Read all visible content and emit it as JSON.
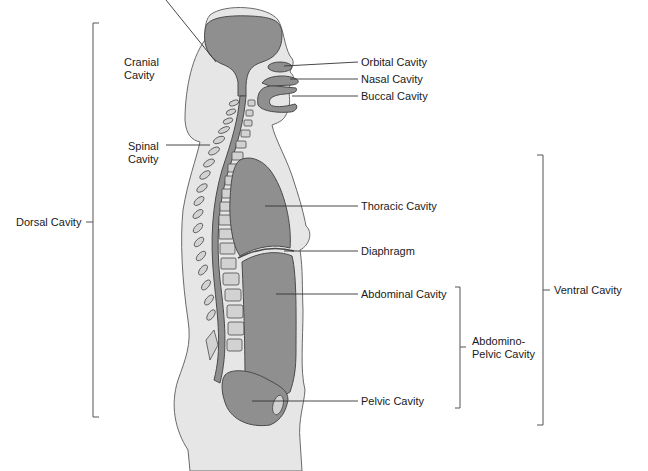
{
  "colors": {
    "body_fill": "#e6e6e6",
    "body_outline": "#6a6a6a",
    "cavity_fill": "#8f8f8f",
    "cavity_outline": "#4a4a4a",
    "vertebra_fill": "#d2d2d2",
    "line": "#333333"
  },
  "labels": {
    "cranial": [
      "Cranial",
      "Cavity"
    ],
    "orbital": "Orbital Cavity",
    "nasal": "Nasal Cavity",
    "buccal": "Buccal Cavity",
    "spinal": [
      "Spinal",
      "Cavity"
    ],
    "dorsal": "Dorsal Cavity",
    "thoracic": "Thoracic Cavity",
    "diaphragm": "Diaphragm",
    "abdominal": "Abdominal Cavity",
    "abdomino_pelvic": [
      "Abdomino-",
      "Pelvic Cavity"
    ],
    "pelvic": "Pelvic Cavity",
    "ventral": "Ventral Cavity"
  },
  "brackets": {
    "dorsal": {
      "x": 93,
      "y1": 23,
      "y2": 417
    },
    "ventral": {
      "x": 543,
      "y1": 155,
      "y2": 425
    },
    "abdomino_pelvic": {
      "x": 460,
      "y1": 287,
      "y2": 408
    }
  }
}
